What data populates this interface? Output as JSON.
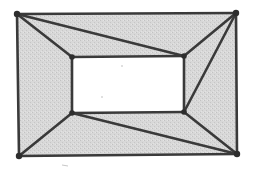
{
  "diagram": {
    "type": "planar-graph",
    "colors": {
      "fill": "#d6d6d6",
      "fill_speckle": "#c4c4c4",
      "edge": "#3a3a3a",
      "vertex": "#2e2e2e",
      "hole": "#ffffff",
      "background": "#ffffff"
    },
    "vertices": [
      {
        "id": "A",
        "name": "outer-top-left",
        "x": 17,
        "y": 14
      },
      {
        "id": "B",
        "name": "outer-top-right",
        "x": 236,
        "y": 13
      },
      {
        "id": "C",
        "name": "outer-bottom-right",
        "x": 237,
        "y": 154
      },
      {
        "id": "D",
        "name": "outer-bottom-left",
        "x": 19,
        "y": 156
      },
      {
        "id": "E",
        "name": "inner-top-left",
        "x": 72,
        "y": 57
      },
      {
        "id": "F",
        "name": "inner-top-right",
        "x": 184,
        "y": 56
      },
      {
        "id": "G",
        "name": "inner-bottom-right",
        "x": 184,
        "y": 112
      },
      {
        "id": "H",
        "name": "inner-bottom-left",
        "x": 72,
        "y": 113
      }
    ],
    "edges": [
      [
        "A",
        "B"
      ],
      [
        "B",
        "C"
      ],
      [
        "C",
        "D"
      ],
      [
        "D",
        "A"
      ],
      [
        "E",
        "F"
      ],
      [
        "F",
        "G"
      ],
      [
        "G",
        "H"
      ],
      [
        "H",
        "E"
      ],
      [
        "A",
        "E"
      ],
      [
        "A",
        "F"
      ],
      [
        "B",
        "F"
      ],
      [
        "B",
        "G"
      ],
      [
        "C",
        "G"
      ],
      [
        "C",
        "H"
      ],
      [
        "D",
        "H"
      ]
    ]
  }
}
